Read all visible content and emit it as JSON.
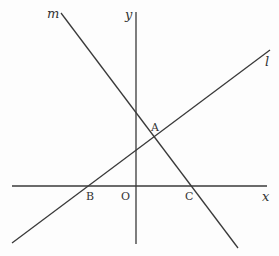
{
  "diagram": {
    "type": "coordinate-geometry",
    "axes": {
      "x_label": "x",
      "y_label": "y",
      "origin_label": "O"
    },
    "lines": [
      {
        "id": "l",
        "label": "l",
        "description": "line rising to the right, through B and A"
      },
      {
        "id": "m",
        "label": "m",
        "description": "line falling to the right, through A and C"
      }
    ],
    "points": [
      {
        "id": "A",
        "label": "A",
        "description": "intersection of line l and line m"
      },
      {
        "id": "B",
        "label": "B",
        "description": "intersection of line l with x-axis"
      },
      {
        "id": "C",
        "label": "C",
        "description": "intersection of line m with x-axis"
      },
      {
        "id": "O",
        "label": "O",
        "description": "origin"
      }
    ],
    "colors": {
      "line": "#3a3a3a",
      "text": "#333333",
      "background": "#fdfdfd"
    }
  }
}
